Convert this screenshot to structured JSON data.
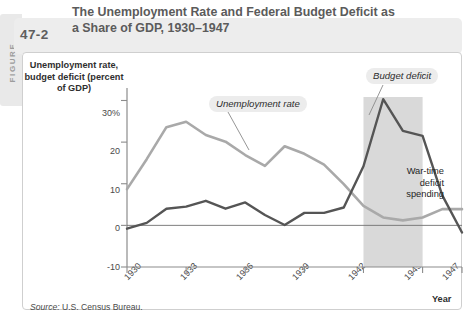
{
  "figure": {
    "tab_label": "FIGURE",
    "number": "47-2",
    "title": "The Unemployment Rate and Federal Budget Deficit as a Share of GDP, 1930–1947",
    "source_prefix": "Source:",
    "source_text": "U.S. Census Bureau."
  },
  "annotations": {
    "unemployment_callout": "Unemployment rate",
    "budget_callout": "Budget deficit",
    "wartime_note_line1": "War-time",
    "wartime_note_line2": "deficit",
    "wartime_note_line3": "spending"
  },
  "colors": {
    "unemployment_line": "#a9a9a9",
    "budget_line": "#555555",
    "shaded_band": "#d9d9d9",
    "axis": "#8c8c8c",
    "header_band": "#ededed",
    "card_border": "#cfcfcf"
  },
  "chart_data": {
    "type": "line",
    "title": "The Unemployment Rate and Federal Budget Deficit as a Share of GDP, 1930–1947",
    "xlabel": "Year",
    "ylabel": "Unemployment rate, budget deficit (percent of GDP)",
    "xlim": [
      1930,
      1947
    ],
    "ylim": [
      -10,
      33
    ],
    "yticks": [
      -10,
      0,
      10,
      20,
      30
    ],
    "ytick_labels": [
      "-10",
      "0",
      "10",
      "20",
      "30%"
    ],
    "xticks": [
      1930,
      1933,
      1936,
      1939,
      1942,
      1945,
      1947
    ],
    "xtick_labels": [
      "1930",
      "1933",
      "1936",
      "1939",
      "1942",
      "1945",
      "1947"
    ],
    "grid": false,
    "zero_line": true,
    "legend_position": "inline-callouts",
    "x": [
      1930,
      1931,
      1932,
      1933,
      1934,
      1935,
      1936,
      1937,
      1938,
      1939,
      1940,
      1941,
      1942,
      1943,
      1944,
      1945,
      1946,
      1947
    ],
    "series": [
      {
        "name": "Unemployment rate",
        "color": "#a9a9a9",
        "values": [
          8.7,
          15.9,
          23.6,
          24.9,
          21.7,
          20.1,
          16.9,
          14.3,
          19.0,
          17.2,
          14.6,
          9.9,
          4.7,
          1.9,
          1.2,
          1.9,
          3.9,
          3.9
        ]
      },
      {
        "name": "Budget deficit",
        "color": "#555555",
        "values": [
          -0.8,
          0.6,
          4.0,
          4.5,
          5.9,
          4.0,
          5.5,
          2.5,
          0.1,
          3.0,
          3.0,
          4.3,
          14.2,
          30.3,
          22.7,
          21.5,
          7.2,
          -1.7
        ]
      }
    ],
    "shaded_region": {
      "label": "War-time deficit spending",
      "x_start": 1942,
      "x_end": 1945,
      "color": "#d9d9d9"
    }
  }
}
